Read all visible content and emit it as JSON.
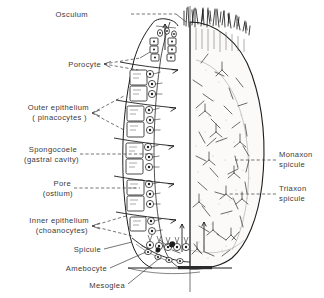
{
  "figure": {
    "background_color": "#ffffff",
    "ink_color": "#1d1d1d",
    "label_color": "#3a3a3a"
  },
  "labels": {
    "osculum": "Osculum",
    "porocyte": "Porocyte",
    "outer_epithelium": "Outer epithelium",
    "outer_epithelium_sub": "( pinacocytes )",
    "spongocoele": "Spongocoele",
    "spongocoele_sub": "(gastral cavity)",
    "pore": "Pore",
    "pore_sub": "(ostium)",
    "inner_epithelium": "Inner epithelium",
    "inner_epithelium_sub": "(choanocytes)",
    "spicule": "Spicule",
    "amebocyte": "Amebocyte",
    "mesoglea": "Mesoglea",
    "monaxon": "Monaxon",
    "monaxon_sub": "spicule",
    "triaxon": "Triaxon",
    "triaxon_sub": "spicule"
  }
}
